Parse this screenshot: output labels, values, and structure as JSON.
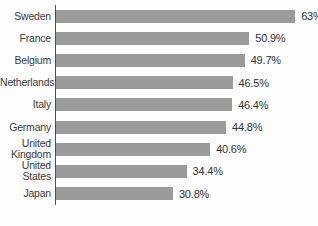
{
  "chart_data": {
    "type": "bar",
    "orientation": "horizontal",
    "title": "",
    "xlabel": "",
    "ylabel": "",
    "categories": [
      "Sweden",
      "France",
      "Belgium",
      "Netherlands",
      "Italy",
      "Germany",
      "United Kingdom",
      "United States",
      "Japan"
    ],
    "values": [
      63,
      50.9,
      49.7,
      46.5,
      46.4,
      44.8,
      40.6,
      34.4,
      30.8
    ],
    "value_labels": [
      "63%",
      "50.9%",
      "49.7%",
      "46.5%",
      "46.4%",
      "44.8%",
      "40.6%",
      "34.4%",
      "30.8%"
    ],
    "xlim": [
      0,
      69
    ],
    "grid": false,
    "legend": false,
    "value_label_position": "right-of-bar",
    "bar_color": "#9b9b9b",
    "axis_line_color": "#4f4f4f",
    "label_text_color": "#3c3c3c",
    "value_text_color": "#333333",
    "background_color": "#fdfdfd"
  }
}
